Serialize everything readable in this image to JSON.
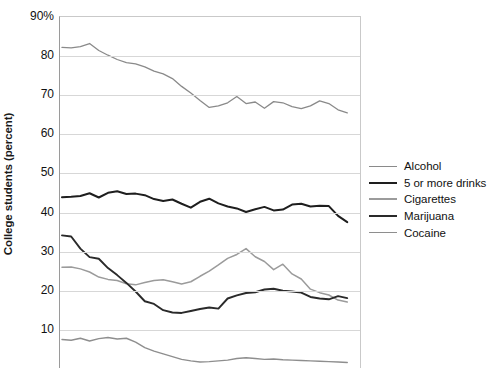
{
  "chart_data": {
    "type": "line",
    "title": "",
    "xlabel": "",
    "ylabel": "College students (percent)",
    "ylim": [
      0,
      90
    ],
    "ytick_labels": [
      "90%",
      "80",
      "70",
      "60",
      "50",
      "40",
      "30",
      "20",
      "10"
    ],
    "ytick_values": [
      90,
      80,
      70,
      60,
      50,
      40,
      30,
      20,
      10
    ],
    "grid": true,
    "legend_position": "right",
    "note": "Bottom of figure is cropped: no x-axis tick labels or axis title are visible.",
    "x": [
      1,
      2,
      3,
      4,
      5,
      6,
      7,
      8,
      9,
      10,
      11,
      12,
      13,
      14,
      15,
      16,
      17,
      18,
      19,
      20,
      21,
      22,
      23,
      24,
      25,
      26,
      27,
      28,
      29,
      30,
      31,
      32
    ],
    "series": [
      {
        "name": "Alcohol",
        "color": "#8a8a8a",
        "width": 1.3,
        "values": [
          82.2,
          82.1,
          82.4,
          83.2,
          81.4,
          80.2,
          79.1,
          78.3,
          78.0,
          77.2,
          76.1,
          75.4,
          74.2,
          72.2,
          70.5,
          68.6,
          66.8,
          67.2,
          68.0,
          69.6,
          67.8,
          68.2,
          66.6,
          68.3,
          68.0,
          67.0,
          66.5,
          67.2,
          68.5,
          67.8,
          66.2,
          65.4
        ]
      },
      {
        "name": "5 or more drinks",
        "color": "#1e1e1e",
        "width": 2.0,
        "values": [
          43.8,
          43.9,
          44.1,
          44.8,
          43.7,
          44.9,
          45.3,
          44.6,
          44.7,
          44.3,
          43.3,
          42.8,
          43.2,
          42.1,
          41.1,
          42.6,
          43.4,
          42.2,
          41.4,
          40.9,
          40.0,
          40.7,
          41.3,
          40.4,
          40.6,
          41.9,
          42.1,
          41.4,
          41.6,
          41.5,
          39.0,
          37.4
        ]
      },
      {
        "name": "Cigarettes",
        "color": "#9b9b9b",
        "width": 1.5,
        "values": [
          25.8,
          25.9,
          25.4,
          24.6,
          23.3,
          22.7,
          22.4,
          21.6,
          21.3,
          21.9,
          22.4,
          22.6,
          22.1,
          21.5,
          22.1,
          23.5,
          24.8,
          26.4,
          28.1,
          29.1,
          30.6,
          28.5,
          27.3,
          25.2,
          26.6,
          24.1,
          22.8,
          20.2,
          19.3,
          18.7,
          17.4,
          16.9
        ]
      },
      {
        "name": "Marijuana",
        "color": "#2a2a2a",
        "width": 1.9,
        "values": [
          34.0,
          33.7,
          30.6,
          28.4,
          28.0,
          25.6,
          23.8,
          21.8,
          19.6,
          17.1,
          16.4,
          14.8,
          14.2,
          14.1,
          14.6,
          15.1,
          15.5,
          15.2,
          17.8,
          18.6,
          19.2,
          19.4,
          20.1,
          20.3,
          19.8,
          19.6,
          19.3,
          18.2,
          17.8,
          17.6,
          18.4,
          17.9
        ]
      },
      {
        "name": "Cocaine",
        "color": "#8e8e8e",
        "width": 1.4,
        "values": [
          7.3,
          7.1,
          7.6,
          6.9,
          7.5,
          7.8,
          7.4,
          7.6,
          6.6,
          5.2,
          4.3,
          3.6,
          2.9,
          2.2,
          1.8,
          1.5,
          1.6,
          1.8,
          2.0,
          2.4,
          2.6,
          2.4,
          2.2,
          2.3,
          2.1,
          2.0,
          1.9,
          1.8,
          1.7,
          1.6,
          1.5,
          1.4
        ]
      }
    ]
  }
}
